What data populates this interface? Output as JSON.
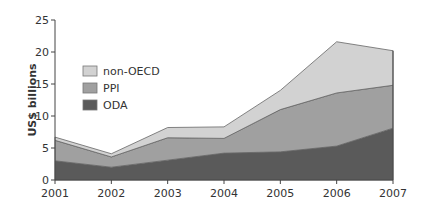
{
  "chart_data": {
    "type": "area",
    "stacked": true,
    "title": "",
    "xlabel": "",
    "ylabel": "US$ billions",
    "ylim": [
      0,
      25
    ],
    "yticks": [
      0,
      5,
      10,
      15,
      20,
      25
    ],
    "x": [
      "2001",
      "2002",
      "2003",
      "2004",
      "2005",
      "2006",
      "2007"
    ],
    "grid": false,
    "legend_position": "upper-left inside",
    "series": [
      {
        "name": "ODA",
        "color": "#5a5a5a",
        "values": [
          3.0,
          2.0,
          3.1,
          4.2,
          4.4,
          5.3,
          8.1
        ]
      },
      {
        "name": "PPI",
        "color": "#a0a0a0",
        "values": [
          3.2,
          1.6,
          3.5,
          2.3,
          6.6,
          8.3,
          6.7
        ]
      },
      {
        "name": "non-OECD",
        "color": "#d2d2d2",
        "values": [
          0.5,
          0.5,
          1.6,
          1.8,
          3.0,
          8.0,
          5.4
        ]
      }
    ],
    "legend": [
      "non-OECD",
      "PPI",
      "ODA"
    ]
  }
}
